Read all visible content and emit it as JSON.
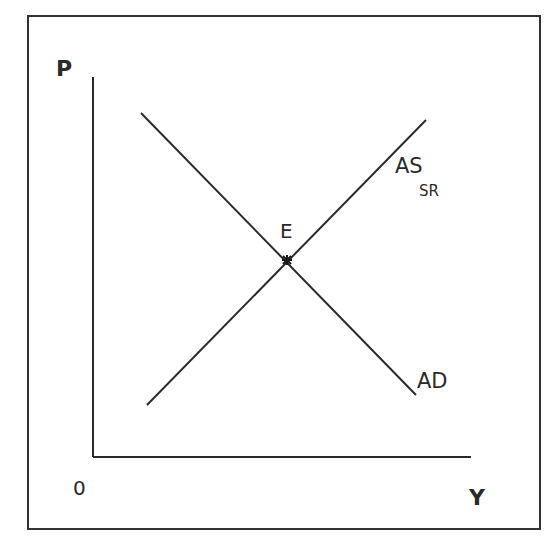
{
  "diagram": {
    "type": "aggregate-supply-demand",
    "axes": {
      "y_label": "P",
      "x_label": "Y",
      "origin_label": "0"
    },
    "curves": [
      {
        "name": "AD",
        "label": "AD",
        "subscript": "",
        "direction": "downward-sloping"
      },
      {
        "name": "AS_SR",
        "label": "AS",
        "subscript": "SR",
        "direction": "upward-sloping"
      }
    ],
    "equilibrium": {
      "label": "E",
      "marker": "asterisk"
    },
    "colors": {
      "line": "#2a2a2a",
      "frame": "#333333",
      "background": "#ffffff"
    }
  }
}
